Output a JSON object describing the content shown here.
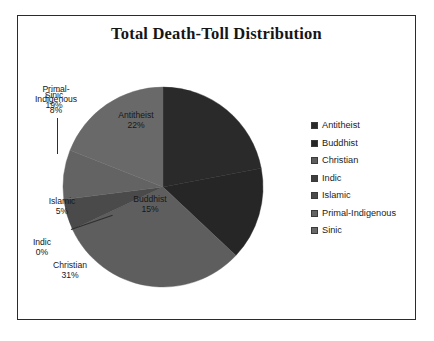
{
  "chart_data": {
    "type": "pie",
    "title": "Total Death-Toll Distribution",
    "xlabel": "",
    "ylabel": "",
    "legend_position": "right",
    "grid": false,
    "categories": [
      "Antitheist",
      "Buddhist",
      "Christian",
      "Indic",
      "Islamic",
      "Primal-Indigenous",
      "Sinic"
    ],
    "values": [
      22,
      15,
      31,
      0,
      5,
      8,
      19
    ],
    "value_unit": "%",
    "slices": [
      {
        "label": "Antitheist",
        "value": 22,
        "pct_text": "22%",
        "color": "#2a2a2a",
        "label_placement": "inside"
      },
      {
        "label": "Buddhist",
        "value": 15,
        "pct_text": "15%",
        "color": "#262626",
        "label_placement": "inside"
      },
      {
        "label": "Christian",
        "value": 31,
        "pct_text": "31%",
        "color": "#5e5e5e",
        "label_placement": "inside"
      },
      {
        "label": "Indic",
        "value": 0,
        "pct_text": "0%",
        "color": "#3f3f3f",
        "label_placement": "outside"
      },
      {
        "label": "Islamic",
        "value": 5,
        "pct_text": "5%",
        "color": "#4a4a4a",
        "label_placement": "inside"
      },
      {
        "label": "Primal-Indigenous",
        "value": 8,
        "pct_text": "8%",
        "color": "#636363",
        "label_placement": "outside"
      },
      {
        "label": "Sinic",
        "value": 19,
        "pct_text": "19%",
        "color": "#696969",
        "label_placement": "inside"
      }
    ]
  },
  "title": "Total Death-Toll Distribution",
  "labels": {
    "antitheist_name": "Antitheist",
    "antitheist_pct": "22%",
    "buddhist_name": "Buddhist",
    "buddhist_pct": "15%",
    "christian_name": "Christian",
    "christian_pct": "31%",
    "indic_name": "Indic",
    "indic_pct": "0%",
    "islamic_name": "Islamic",
    "islamic_pct": "5%",
    "primal_name_line1": "Primal-",
    "primal_name_line2": "Indigenous",
    "primal_pct": "8%",
    "sinic_name": "Sinic",
    "sinic_pct": "19%"
  },
  "legend": {
    "items": [
      {
        "label": "Antitheist",
        "color": "#2a2a2a"
      },
      {
        "label": "Buddhist",
        "color": "#262626"
      },
      {
        "label": "Christian",
        "color": "#5e5e5e"
      },
      {
        "label": "Indic",
        "color": "#3f3f3f"
      },
      {
        "label": "Islamic",
        "color": "#4a4a4a"
      },
      {
        "label": "Primal-Indigenous",
        "color": "#636363"
      },
      {
        "label": "Sinic",
        "color": "#696969"
      }
    ]
  },
  "colors": {
    "background": "#ffffff",
    "frame": "#2b2b2b",
    "title_text": "#161616",
    "label_text": "#1a1a1a"
  }
}
